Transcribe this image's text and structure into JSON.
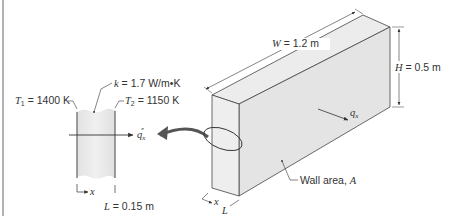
{
  "figure": {
    "type": "heat-conduction-plane-wall",
    "colors": {
      "line": "#333333",
      "wall_fill": "#e6e6e6",
      "wall_fill_light": "#f2f2f2",
      "wall_side": "#dcdcdc",
      "frame_line": "#9a9a9a"
    }
  },
  "detail": {
    "k": {
      "symbol": "k",
      "eq": " = 1.7 W/m•K"
    },
    "T1": {
      "symbol": "T",
      "sub": "1",
      "eq": " = 1400 K"
    },
    "T2": {
      "symbol": "T",
      "sub": "2",
      "eq": " = 1150 K"
    },
    "flux": {
      "symbol": "q",
      "sub": "x",
      "sup": "″"
    },
    "x_axis": "x",
    "L": {
      "symbol": "L",
      "eq": " = 0.15 m"
    }
  },
  "wall3d": {
    "W": {
      "symbol": "W",
      "eq": " = 1.2 m"
    },
    "H": {
      "symbol": "H",
      "eq": " = 0.5 m"
    },
    "q": {
      "symbol": "q",
      "sub": "x"
    },
    "area": {
      "text": "Wall area, ",
      "symbol": "A"
    },
    "x_axis": "x",
    "L": "L"
  }
}
